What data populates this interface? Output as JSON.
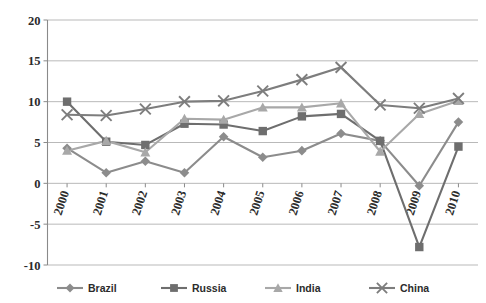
{
  "chart_data": {
    "type": "line",
    "title": "",
    "subtitle": "",
    "xlabel": "",
    "ylabel": "",
    "categories": [
      "2000",
      "2001",
      "2002",
      "2003",
      "2004",
      "2005",
      "2006",
      "2007",
      "2008",
      "2009",
      "2010"
    ],
    "x_tick_labels": [
      "2000",
      "2001",
      "2002",
      "2003",
      "2004",
      "2005",
      "2006",
      "2007",
      "2008",
      "2009",
      "2010"
    ],
    "y_tick_labels": [
      "20",
      "15",
      "10",
      "5",
      "0",
      "-5",
      "-10"
    ],
    "y_tick_values": [
      20,
      15,
      10,
      5,
      0,
      -5,
      -10
    ],
    "ylim": [
      -10,
      20
    ],
    "grid": true,
    "legend_position": "bottom",
    "series": [
      {
        "name": "Brazil",
        "marker": "diamond",
        "color": "#8c8c8c",
        "values": [
          4.3,
          1.3,
          2.7,
          1.3,
          5.7,
          3.2,
          4.0,
          6.1,
          5.2,
          -0.3,
          7.5
        ]
      },
      {
        "name": "Russia",
        "marker": "square",
        "color": "#6e6e6e",
        "values": [
          10.0,
          5.1,
          4.7,
          7.3,
          7.2,
          6.4,
          8.2,
          8.5,
          5.2,
          -7.8,
          4.5
        ]
      },
      {
        "name": "India",
        "marker": "triangle",
        "color": "#a8a8a8",
        "values": [
          4.0,
          5.2,
          3.8,
          7.9,
          7.8,
          9.3,
          9.3,
          9.8,
          3.9,
          8.5,
          10.1
        ]
      },
      {
        "name": "China",
        "marker": "x",
        "color": "#7d7d7d",
        "values": [
          8.4,
          8.3,
          9.1,
          10.0,
          10.1,
          11.3,
          12.7,
          14.2,
          9.6,
          9.2,
          10.4
        ]
      }
    ]
  },
  "legend": {
    "items": [
      {
        "label": "Brazil",
        "marker": "diamond",
        "color": "#8c8c8c"
      },
      {
        "label": "Russia",
        "marker": "square",
        "color": "#6e6e6e"
      },
      {
        "label": "India",
        "marker": "triangle",
        "color": "#a8a8a8"
      },
      {
        "label": "China",
        "marker": "x",
        "color": "#7d7d7d"
      }
    ]
  },
  "colors": {
    "gridline": "#b9b9b9",
    "axis": "#8a8a8a",
    "text": "#2b2b2b",
    "background": "#ffffff"
  }
}
